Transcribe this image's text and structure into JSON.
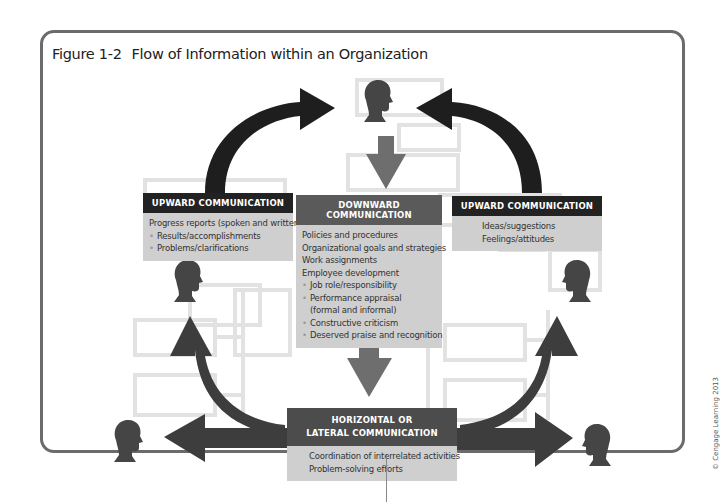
{
  "figure": {
    "number": "Figure 1-2",
    "title": "Flow of Information within an Organization",
    "copyright": "© Cengage Learning 2013"
  },
  "boxes": {
    "upward_left": {
      "header": "UPWARD COMMUNICATION",
      "items": [
        {
          "text": "Progress reports (spoken and written)",
          "bullet": false
        },
        {
          "text": "Results/accomplishments",
          "bullet": true
        },
        {
          "text": "Problems/clarifications",
          "bullet": true
        }
      ]
    },
    "downward": {
      "header": "DOWNWARD COMMUNICATION",
      "items": [
        {
          "text": "Policies and procedures",
          "bullet": false
        },
        {
          "text": "Organizational goals and strategies",
          "bullet": false
        },
        {
          "text": "Work assignments",
          "bullet": false
        },
        {
          "text": "Employee development",
          "bullet": false
        },
        {
          "text": "Job role/responsibility",
          "bullet": true
        },
        {
          "text": "Performance appraisal",
          "bullet": true
        },
        {
          "text": "(formal and informal)",
          "bullet": false,
          "indent": true
        },
        {
          "text": "Constructive criticism",
          "bullet": true
        },
        {
          "text": "Deserved praise and recognition",
          "bullet": true
        }
      ]
    },
    "upward_right": {
      "header": "UPWARD COMMUNICATION",
      "items": [
        {
          "text": "Ideas/suggestions",
          "bullet": false
        },
        {
          "text": "Feelings/attitudes",
          "bullet": false
        }
      ]
    },
    "horizontal": {
      "header_line1": "HORIZONTAL OR",
      "header_line2": "LATERAL COMMUNICATION",
      "items": [
        {
          "text": "Coordination of interrelated activities",
          "bullet": false
        },
        {
          "text": "Problem-solving efforts",
          "bullet": false
        }
      ]
    }
  },
  "colors": {
    "frame": "#6b6b6b",
    "black_arrow": "#1e1e1e",
    "gray_arrow": "#6e6e6e",
    "dark_arrow": "#3d3d3d",
    "head": "#454545",
    "box_body": "#cfcfcf",
    "org_chart_lines": "#e2e2e2"
  }
}
